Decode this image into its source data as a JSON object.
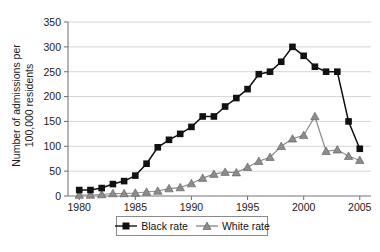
{
  "chart_data": {
    "type": "line",
    "title": "",
    "xlabel": "",
    "ylabel": "Number of admissions per 100,000 residents",
    "ylabel_line1": "Number of admissions per",
    "ylabel_line2": "100,000 residents",
    "x": [
      1980,
      1981,
      1982,
      1983,
      1984,
      1985,
      1986,
      1987,
      1988,
      1989,
      1990,
      1991,
      1992,
      1993,
      1994,
      1995,
      1996,
      1997,
      1998,
      1999,
      2000,
      2001,
      2002,
      2003,
      2004,
      2005
    ],
    "xlim": [
      1979,
      2006
    ],
    "ylim": [
      0,
      350
    ],
    "yticks": [
      0,
      50,
      100,
      150,
      200,
      250,
      300,
      350
    ],
    "xticks": [
      1980,
      1985,
      1990,
      1995,
      2000,
      2005
    ],
    "xtick_labels": [
      "1980",
      "1985",
      "1990",
      "1995",
      "2000",
      "2005"
    ],
    "ytick_labels": [
      "0",
      "50",
      "100",
      "150",
      "200",
      "250",
      "300",
      "350"
    ],
    "grid": true,
    "grid_axis": "y",
    "legend_position": "bottom-center",
    "series": [
      {
        "name": "Black rate",
        "color": "#111111",
        "marker": "square",
        "values": [
          12,
          12,
          16,
          24,
          30,
          41,
          65,
          98,
          113,
          125,
          139,
          160,
          160,
          180,
          197,
          215,
          245,
          250,
          270,
          300,
          282,
          260,
          250,
          250,
          150,
          95
        ]
      },
      {
        "name": "White rate",
        "color": "#8c8c8c",
        "marker": "triangle",
        "values": [
          2,
          2,
          3,
          5,
          5,
          6,
          8,
          10,
          15,
          17,
          25,
          36,
          44,
          48,
          47,
          58,
          70,
          78,
          100,
          115,
          122,
          160,
          90,
          93,
          80,
          72
        ]
      }
    ]
  },
  "legend": {
    "entries": [
      {
        "label": "Black rate",
        "marker": "square",
        "color": "#111111"
      },
      {
        "label": "White rate",
        "marker": "triangle",
        "color": "#8c8c8c"
      }
    ]
  }
}
